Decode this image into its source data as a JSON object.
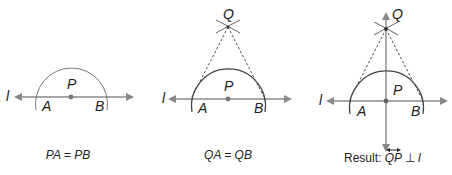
{
  "panels": [
    {
      "id": "step1",
      "line_label": "l",
      "points": {
        "A": "A",
        "P": "P",
        "B": "B"
      },
      "caption": "PA = PB"
    },
    {
      "id": "step2",
      "line_label": "l",
      "points": {
        "A": "A",
        "P": "P",
        "B": "B",
        "Q": "Q"
      },
      "caption": "QA = QB"
    },
    {
      "id": "step3",
      "line_label": "l",
      "points": {
        "A": "A",
        "P": "P",
        "B": "B",
        "Q": "Q"
      },
      "caption_prefix": "Result: ",
      "caption_segment": "QP",
      "caption_perp": "⊥",
      "caption_line": "l"
    }
  ],
  "colors": {
    "line": "#888888",
    "arc": "#555555",
    "text": "#222222"
  }
}
